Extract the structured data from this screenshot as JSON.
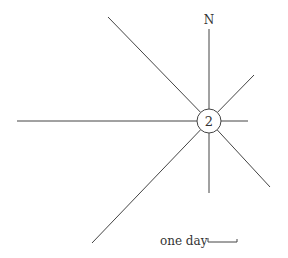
{
  "diagram": {
    "type": "wind-rose",
    "north_label": "N",
    "hub_label": "2",
    "scale_label": "one day",
    "center": [
      209,
      121
    ],
    "hub_radius": 12,
    "rays": [
      {
        "direction": "N",
        "end": [
          209,
          29
        ]
      },
      {
        "direction": "NE",
        "end": [
          254,
          75
        ]
      },
      {
        "direction": "E",
        "end": [
          248,
          121
        ]
      },
      {
        "direction": "SE",
        "end": [
          270,
          187
        ]
      },
      {
        "direction": "S",
        "end": [
          209,
          193
        ]
      },
      {
        "direction": "SW",
        "end": [
          92,
          243
        ]
      },
      {
        "direction": "W",
        "end": [
          17,
          121
        ]
      },
      {
        "direction": "NW",
        "end": [
          108,
          17
        ]
      }
    ],
    "colors": {
      "line": "#444444",
      "text": "#333333",
      "background": "#ffffff"
    }
  }
}
